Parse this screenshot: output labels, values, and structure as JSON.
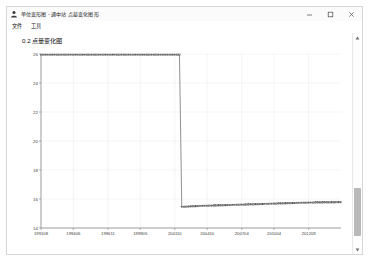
{
  "window": {
    "title": "单位变形图 - 通中站 点墓变化图形",
    "icon": "person-icon",
    "controls": {
      "minimize": "minimize-icon",
      "maximize": "maximize-icon",
      "close": "close-icon"
    }
  },
  "menu": {
    "items": [
      {
        "label": "文件",
        "name": "menu-item-file"
      },
      {
        "label": "工具",
        "name": "menu-item-tools"
      }
    ]
  },
  "scrollbar": {
    "up_arrow": "chevron-up-icon",
    "down_arrow": "chevron-down-icon"
  },
  "chart_data": {
    "type": "line",
    "title": "0.2 点量变化图",
    "xlabel": "",
    "ylabel": "",
    "ylim": [
      14,
      26
    ],
    "yticks": [
      14,
      16,
      18,
      20,
      22,
      24,
      26
    ],
    "grid": true,
    "legend": null,
    "marker": "square",
    "line_color": "#555555",
    "grid_color": "#e9e9e9",
    "axis_color": "#7a7a7a",
    "xtick_labels": [
      "199108",
      "199406",
      "199611",
      "199905",
      "200110",
      "200410",
      "200704",
      "201004",
      "201209"
    ],
    "x": [
      "199108",
      "199110",
      "199112",
      "199202",
      "199204",
      "199206",
      "199208",
      "199210",
      "199212",
      "199302",
      "199304",
      "199306",
      "199308",
      "199310",
      "199312",
      "199402",
      "199404",
      "199406",
      "199408",
      "199410",
      "199412",
      "199502",
      "199504",
      "199506",
      "199508",
      "199510",
      "199512",
      "199602",
      "199604",
      "199606",
      "199608",
      "199610",
      "199611",
      "199702",
      "199704",
      "199706",
      "199708",
      "199710",
      "199712",
      "199802",
      "199804",
      "199806",
      "199808",
      "199810",
      "199812",
      "199902",
      "199904",
      "199905",
      "199908",
      "199910",
      "199912",
      "200002",
      "200004",
      "200006",
      "200008",
      "200010",
      "200012",
      "200102",
      "200104",
      "200106",
      "200108",
      "200110",
      "200112",
      "200202",
      "200204",
      "200206",
      "200208",
      "200210",
      "200212",
      "200302",
      "200304",
      "200306",
      "200308",
      "200310",
      "200312",
      "200402",
      "200404",
      "200406",
      "200408",
      "200410",
      "200412",
      "200502",
      "200504",
      "200506",
      "200508",
      "200510",
      "200512",
      "200602",
      "200604",
      "200606",
      "200608",
      "200610",
      "200612",
      "200702",
      "200704",
      "200706",
      "200708",
      "200710",
      "200712",
      "200802",
      "200804",
      "200806",
      "200808",
      "200810",
      "200812",
      "200902",
      "200904",
      "200906",
      "200908",
      "200910",
      "200912",
      "201002",
      "201004",
      "201006",
      "201008",
      "201010",
      "201012",
      "201102",
      "201104",
      "201106",
      "201108",
      "201110",
      "201112",
      "201202",
      "201204",
      "201206",
      "201208",
      "201209",
      "201212",
      "201302",
      "201304"
    ],
    "values": [
      25.95,
      25.95,
      25.95,
      25.95,
      25.95,
      25.95,
      25.95,
      25.95,
      25.95,
      25.95,
      25.95,
      25.95,
      25.95,
      25.95,
      25.95,
      25.95,
      25.95,
      25.95,
      25.95,
      25.95,
      25.95,
      25.95,
      25.95,
      25.95,
      25.95,
      25.95,
      25.95,
      25.95,
      25.95,
      25.95,
      25.95,
      25.95,
      25.95,
      25.95,
      25.95,
      25.95,
      25.95,
      25.95,
      25.95,
      25.95,
      25.95,
      25.95,
      25.95,
      25.95,
      25.95,
      25.95,
      25.95,
      25.95,
      25.95,
      25.95,
      25.95,
      25.95,
      25.95,
      25.95,
      25.95,
      25.95,
      25.95,
      25.95,
      25.95,
      25.95,
      25.95,
      15.45,
      15.46,
      15.47,
      15.48,
      15.49,
      15.5,
      15.5,
      15.51,
      15.52,
      15.52,
      15.53,
      15.53,
      15.54,
      15.54,
      15.55,
      15.55,
      15.56,
      15.56,
      15.57,
      15.57,
      15.58,
      15.58,
      15.59,
      15.59,
      15.6,
      15.6,
      15.61,
      15.61,
      15.62,
      15.62,
      15.63,
      15.63,
      15.64,
      15.64,
      15.65,
      15.65,
      15.66,
      15.66,
      15.67,
      15.67,
      15.68,
      15.68,
      15.69,
      15.69,
      15.7,
      15.7,
      15.71,
      15.71,
      15.72,
      15.72,
      15.73,
      15.73,
      15.74,
      15.74,
      15.74,
      15.75,
      15.75,
      15.75,
      15.76,
      15.76,
      15.76,
      15.76,
      15.77,
      15.77,
      15.77,
      15.77,
      15.77,
      15.78,
      15.78,
      15.78
    ]
  }
}
